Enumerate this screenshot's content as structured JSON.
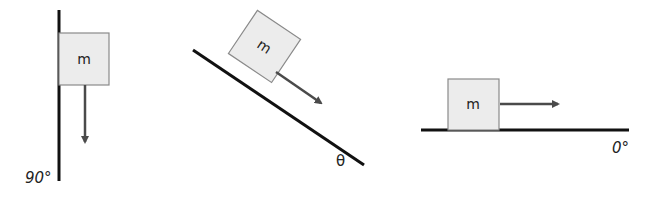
{
  "colors": {
    "surface": "#111111",
    "box_fill": "#ececec",
    "box_stroke": "#8a8a8a",
    "arrow": "#4a4a4a"
  },
  "panels": [
    {
      "id": "vertical",
      "mass_label": "m",
      "angle_label": "90°",
      "arrow_direction": "down"
    },
    {
      "id": "incline",
      "mass_label": "m",
      "angle_label": "θ",
      "arrow_direction": "down-slope"
    },
    {
      "id": "horizontal",
      "mass_label": "m",
      "angle_label": "0°",
      "arrow_direction": "right"
    }
  ]
}
